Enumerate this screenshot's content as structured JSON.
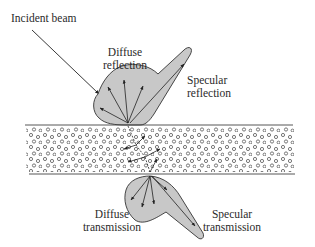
{
  "diagram": {
    "labels": {
      "incident_beam": "Incident beam",
      "diffuse_reflection": [
        "Diffuse",
        "reflection"
      ],
      "specular_reflection": [
        "Specular",
        "reflection"
      ],
      "diffuse_transmission": [
        "Diffuse",
        "transmission"
      ],
      "specular_transmission": [
        "Specular",
        "transmission"
      ]
    },
    "colors": {
      "lobe_fill": "#c8c8c8",
      "stroke": "#333333",
      "particle": "#555555",
      "text": "#2a2a2a"
    }
  }
}
